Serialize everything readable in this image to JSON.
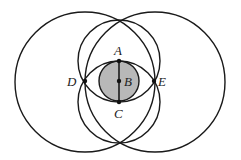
{
  "diagram": {
    "title": "",
    "colors": {
      "stroke": "#1a1a1a",
      "shade": "#b8b8b8",
      "label": "#222222",
      "background": "#ffffff"
    },
    "points": {
      "A": {
        "label": "A",
        "x": 119,
        "y": 61
      },
      "B": {
        "label": "B",
        "x": 119,
        "y": 81
      },
      "C": {
        "label": "C",
        "x": 119,
        "y": 102
      },
      "D": {
        "label": "D",
        "x": 85,
        "y": 81
      },
      "E": {
        "label": "E",
        "x": 154,
        "y": 81
      }
    },
    "circles": [
      {
        "name": "big-left",
        "cx": 85,
        "cy": 82,
        "r": 70
      },
      {
        "name": "big-right",
        "cx": 155,
        "cy": 82,
        "r": 70
      },
      {
        "name": "circle-center-A",
        "cx": 119,
        "cy": 61,
        "r": 41
      },
      {
        "name": "circle-center-C",
        "cx": 119,
        "cy": 102,
        "r": 41
      },
      {
        "name": "shaded-circle-center-B",
        "cx": 119,
        "cy": 81,
        "r": 20,
        "shaded": true
      }
    ],
    "segments": [
      {
        "from": "A",
        "to": "C"
      }
    ]
  }
}
